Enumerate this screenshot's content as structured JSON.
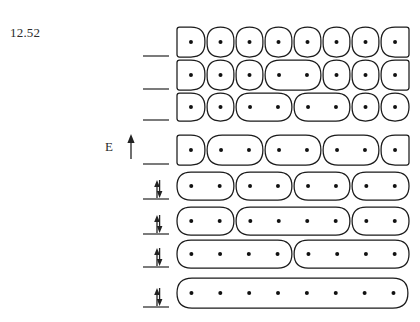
{
  "figure": {
    "number": "12.52",
    "axis_label": "E",
    "axis_direction": "up"
  },
  "diagram": {
    "type": "particle-in-a-box level diagram",
    "total_sites": 8,
    "dot_symbol": "electron-dot",
    "rows": [
      {
        "index": 1,
        "marker": "single-line",
        "cells": [
          1,
          1,
          1,
          1,
          1,
          1,
          1,
          1
        ],
        "dot_total": 8
      },
      {
        "index": 2,
        "marker": "single-line",
        "cells": [
          1,
          1,
          1,
          2,
          1,
          1,
          1
        ],
        "dot_total": 8
      },
      {
        "index": 3,
        "marker": "single-line",
        "cells": [
          1,
          1,
          2,
          2,
          1,
          1
        ],
        "dot_total": 8
      },
      {
        "index": 4,
        "marker": "single-line",
        "cells": [
          1,
          2,
          2,
          2,
          1
        ],
        "dot_total": 8
      },
      {
        "index": 5,
        "marker": "double-arrow",
        "cells": [
          2,
          2,
          2,
          2
        ],
        "dot_total": 8
      },
      {
        "index": 6,
        "marker": "double-arrow",
        "cells": [
          2,
          4,
          2
        ],
        "dot_total": 8
      },
      {
        "index": 7,
        "marker": "double-arrow",
        "cells": [
          4,
          4
        ],
        "dot_total": 8
      },
      {
        "index": 8,
        "marker": "double-arrow",
        "cells": [
          8
        ],
        "dot_total": 8
      }
    ]
  },
  "colors": {
    "outline": "#1a1a1a",
    "dot": "#111111",
    "tick": "#333333",
    "text": "#2b2b2b",
    "background": "#ffffff"
  }
}
